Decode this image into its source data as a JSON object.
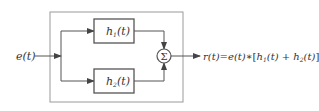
{
  "diagram": {
    "type": "block-diagram",
    "input": {
      "label": "e(t)"
    },
    "blocks": [
      {
        "id": "h1",
        "label_main": "h",
        "label_sub": "1",
        "label_arg": "(t)"
      },
      {
        "id": "h2",
        "label_main": "h",
        "label_sub": "2",
        "label_arg": "(t)"
      }
    ],
    "summer": {
      "symbol": "Σ"
    },
    "output": {
      "lhs": "r(t)",
      "eq": "=",
      "rhs_a": "e(t)",
      "op": "∗",
      "open": "[",
      "h1": "h",
      "h1_sub": "1",
      "h1_arg": "(t)",
      "plus": " + ",
      "h2": "h",
      "h2_sub": "2",
      "h2_arg": "(t)",
      "close": "]"
    },
    "colors": {
      "line": "#555555",
      "text": "#333333",
      "frame": "#888888"
    }
  }
}
